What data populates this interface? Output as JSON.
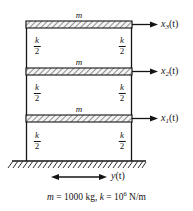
{
  "figure": {
    "caption": {
      "mass_symbol": "m",
      "equals_1": "=",
      "mass_value": "1000 kg,",
      "stiffness_symbol": "k",
      "equals_2": "=",
      "stiffness_base": "10",
      "stiffness_exponent": "6",
      "stiffness_units": "N/m",
      "full_text": "m = 1000 kg, k = 10^6 N/m"
    },
    "floors": [
      {
        "id": "floor-3",
        "mass_label": "m",
        "displacement_symbol": "x",
        "displacement_subscript": "3",
        "displacement_arg": "(t)",
        "displacement_label": "x3(t)"
      },
      {
        "id": "floor-2",
        "mass_label": "m",
        "displacement_symbol": "x",
        "displacement_subscript": "2",
        "displacement_arg": "(t)",
        "displacement_label": "x2(t)"
      },
      {
        "id": "floor-1",
        "mass_label": "m",
        "displacement_symbol": "x",
        "displacement_subscript": "1",
        "displacement_arg": "(t)",
        "displacement_label": "x1(t)"
      }
    ],
    "springs": {
      "numerator": "k",
      "denominator": "2",
      "label": "k/2",
      "count": 6,
      "positions": [
        "story-3-left",
        "story-3-right",
        "story-2-left",
        "story-2-right",
        "story-1-left",
        "story-1-right"
      ]
    },
    "ground": {
      "excitation_symbol": "y",
      "excitation_arg": "(t)",
      "excitation_label": "y(t)"
    },
    "colors": {
      "line": "#141414",
      "hatch": "#4a4a4a",
      "fill": "#f2f2f2",
      "background": "#ffffff",
      "text": "#141414"
    }
  }
}
